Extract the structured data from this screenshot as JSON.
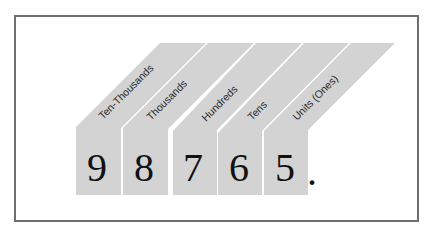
{
  "diagram": {
    "places": [
      {
        "label": "Ten-Thousands",
        "digit": "9"
      },
      {
        "label": "Thousands",
        "digit": "8"
      },
      {
        "label": "Hundreds",
        "digit": "7"
      },
      {
        "label": "Tens",
        "digit": "6"
      },
      {
        "label": "Units (Ones)",
        "digit": "5"
      }
    ],
    "decimal_point": ".",
    "colors": {
      "band_fill": "#d3d3d3",
      "frame_border": "#6e6e6e",
      "digit_color": "#111111",
      "label_color": "#2a2a2a"
    }
  }
}
